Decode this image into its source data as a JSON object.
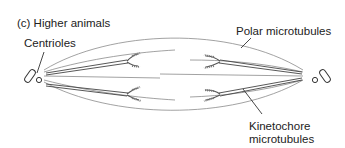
{
  "figure": {
    "panel_label": "(c) Higher animals",
    "labels": {
      "centrioles": "Centrioles",
      "polar_microtubules": "Polar microtubules",
      "kinetochore_line1": "Kinetochore",
      "kinetochore_line2": "microtubules"
    },
    "colors": {
      "line": "#555555",
      "thin_line": "#888888",
      "text": "#222222",
      "background": "#ffffff"
    }
  }
}
